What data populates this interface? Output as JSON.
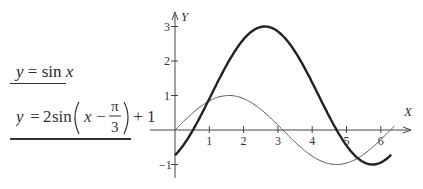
{
  "legend": {
    "eq1": {
      "lhs": "y",
      "eq": " = ",
      "fn": "sin",
      "arg": " x"
    },
    "eq2": {
      "lhs": "y",
      "eq": " = ",
      "coef": "2",
      "fn": "sin",
      "arg": "x",
      "minus": " − ",
      "num": "π",
      "den": "3",
      "tail": " + 1"
    }
  },
  "chart_data": {
    "type": "line",
    "title": "",
    "xlabel": "X",
    "ylabel": "Y",
    "xlim": [
      0,
      6.8
    ],
    "ylim": [
      -1.2,
      3.3
    ],
    "x_ticks": [
      1,
      2,
      3,
      4,
      5,
      6
    ],
    "x_tick_labels": [
      "1",
      "2",
      "3",
      "4",
      "5",
      "6"
    ],
    "y_ticks": [
      -1,
      1,
      2,
      3
    ],
    "y_tick_labels": [
      "−1",
      "1",
      "2",
      "3"
    ],
    "grid": false,
    "series": [
      {
        "name": "y = sin x",
        "style": "thin",
        "color": "#555555",
        "x_range": [
          0,
          6.4
        ],
        "x": [
          0,
          0.5,
          1,
          1.57,
          2,
          2.5,
          3,
          3.14,
          3.5,
          4,
          4.5,
          4.71,
          5,
          5.5,
          6,
          6.4
        ],
        "values": [
          0,
          0.48,
          0.84,
          1,
          0.91,
          0.6,
          0.14,
          0,
          -0.35,
          -0.76,
          -0.98,
          -1,
          -0.96,
          -0.71,
          -0.28,
          0.12
        ]
      },
      {
        "name": "y = 2sin(x − π/3) + 1",
        "style": "thick",
        "color": "#222222",
        "x_range": [
          0,
          6.3
        ],
        "x": [
          0,
          0.5,
          1,
          1.5,
          2,
          2.62,
          3,
          3.5,
          4,
          4.5,
          5,
          5.5,
          5.76,
          6,
          6.3
        ],
        "values": [
          -0.73,
          0.06,
          0.9,
          1.86,
          2.6,
          3,
          2.86,
          2.4,
          1.62,
          0.68,
          -0.18,
          -0.85,
          -1,
          -0.94,
          -0.73
        ]
      }
    ]
  }
}
